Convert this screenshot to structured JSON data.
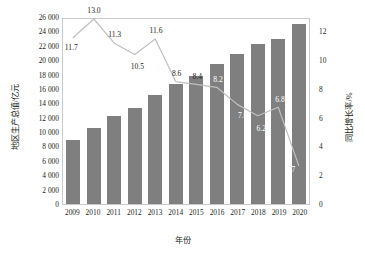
{
  "chart_data": {
    "type": "bar",
    "title": "",
    "xlabel": "年份",
    "ylabel": "地区生产总值/亿元",
    "y2label": "同比增长率/%",
    "categories": [
      "2009",
      "2010",
      "2011",
      "2012",
      "2013",
      "2014",
      "2015",
      "2016",
      "2017",
      "2018",
      "2019",
      "2020"
    ],
    "ylim": [
      0,
      26000
    ],
    "y2lim": [
      0,
      13
    ],
    "grid": false,
    "legend": "none",
    "series": [
      {
        "name": "地区生产总值/亿元",
        "type": "bar",
        "axis": "left",
        "color": "#7f7f7f",
        "values": [
          8900,
          10600,
          12200,
          13400,
          15200,
          16700,
          17800,
          19500,
          20900,
          22200,
          23000,
          25000
        ]
      },
      {
        "name": "同比增长率/%",
        "type": "line",
        "axis": "right",
        "color": "#bfbfbf",
        "values": [
          11.7,
          13.0,
          11.3,
          10.5,
          11.6,
          8.6,
          8.4,
          8.2,
          7.0,
          6.2,
          6.8,
          2.7
        ],
        "labels": [
          "11.7",
          "13.0",
          "11.3",
          "10.5",
          "11.6",
          "8.6",
          "8.4",
          "8.2",
          "7.0",
          "6.2",
          "6.8",
          "2.7"
        ]
      }
    ],
    "y_ticks": [
      "0",
      "2 000",
      "4 000",
      "6 000",
      "8 000",
      "10 000",
      "12 000",
      "14 000",
      "16 000",
      "18 000",
      "20 000",
      "22 000",
      "24 000",
      "26 000"
    ],
    "y_tick_values": [
      0,
      2000,
      4000,
      6000,
      8000,
      10000,
      12000,
      14000,
      16000,
      18000,
      20000,
      22000,
      24000,
      26000
    ],
    "y2_ticks": [
      "0",
      "2",
      "4",
      "6",
      "8",
      "10",
      "12"
    ],
    "y2_tick_values": [
      0,
      2,
      4,
      6,
      8,
      10,
      12
    ]
  }
}
